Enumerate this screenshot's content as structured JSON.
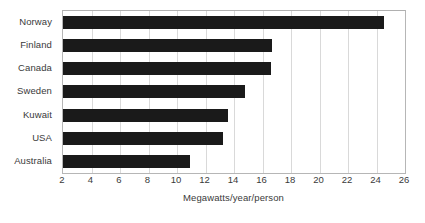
{
  "chart_data": {
    "type": "bar",
    "orientation": "horizontal",
    "title": "",
    "subtitle": "",
    "xlabel": "Megawatts/year/person",
    "ylabel": "",
    "categories": [
      "Norway",
      "Finland",
      "Canada",
      "Sweden",
      "Kuwait",
      "USA",
      "Australia"
    ],
    "values": [
      24.5,
      16.7,
      16.6,
      14.8,
      13.6,
      13.2,
      10.9
    ],
    "series": [
      {
        "name": "Electricity consumption",
        "values": [
          24.5,
          16.7,
          16.6,
          14.8,
          13.6,
          13.2,
          10.9
        ]
      }
    ],
    "xlim": [
      2,
      26
    ],
    "ylim": null,
    "xticks": [
      2,
      4,
      6,
      8,
      10,
      12,
      14,
      16,
      18,
      20,
      22,
      24,
      26
    ],
    "xtick_labels": [
      "2",
      "4",
      "6",
      "8",
      "10",
      "12",
      "14",
      "16",
      "18",
      "20",
      "22",
      "24",
      "26"
    ],
    "grid": "vertical",
    "legend": null,
    "legend_position": "none",
    "bar_color": "#1a1a1a",
    "gridline_color": "#d9d9d9",
    "axis_color": "#b6b6b6",
    "text_color": "#3a3a3a",
    "background_color": "#ffffff",
    "annotations": []
  }
}
